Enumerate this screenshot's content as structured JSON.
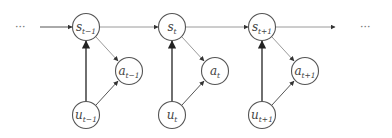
{
  "diagram": {
    "ellipsis_left": "···",
    "ellipsis_right": "···",
    "colors": {
      "node_stroke": "#555555",
      "edge_dark": "#333333",
      "edge_light": "#9a9a9a",
      "text": "#444444"
    },
    "nodes": {
      "s_prev": {
        "base": "s",
        "sub": "t−1"
      },
      "a_prev": {
        "base": "a",
        "sub": "t−1"
      },
      "u_prev": {
        "base": "u",
        "sub": "t−1"
      },
      "s_cur": {
        "base": "s",
        "sub": "t"
      },
      "a_cur": {
        "base": "a",
        "sub": "t"
      },
      "u_cur": {
        "base": "u",
        "sub": "t"
      },
      "s_next": {
        "base": "s",
        "sub": "t+1"
      },
      "a_next": {
        "base": "a",
        "sub": "t+1"
      },
      "u_next": {
        "base": "u",
        "sub": "t+1"
      }
    },
    "edges": [
      {
        "from": "ellipsis_left",
        "to": "s_prev"
      },
      {
        "from": "s_prev",
        "to": "s_cur"
      },
      {
        "from": "s_cur",
        "to": "s_next"
      },
      {
        "from": "s_next",
        "to": "ellipsis_right"
      },
      {
        "from": "s_prev",
        "to": "a_prev"
      },
      {
        "from": "u_prev",
        "to": "s_prev"
      },
      {
        "from": "u_prev",
        "to": "a_prev"
      },
      {
        "from": "s_cur",
        "to": "a_cur"
      },
      {
        "from": "u_cur",
        "to": "s_cur"
      },
      {
        "from": "u_cur",
        "to": "a_cur"
      },
      {
        "from": "s_next",
        "to": "a_next"
      },
      {
        "from": "u_next",
        "to": "s_next"
      },
      {
        "from": "u_next",
        "to": "a_next"
      }
    ]
  }
}
